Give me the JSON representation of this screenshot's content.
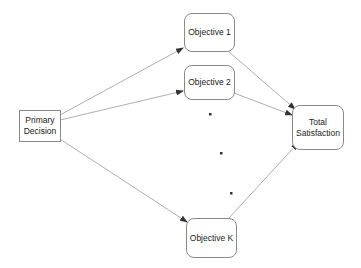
{
  "diagram": {
    "nodes": {
      "primary_decision": {
        "lines": [
          "Primary",
          "Decision"
        ]
      },
      "objective_1": {
        "label": "Objective 1"
      },
      "objective_2": {
        "label": "Objective 2"
      },
      "objective_k": {
        "label": "Objective K"
      },
      "total_satisfaction": {
        "lines": [
          "Total",
          "Satisfaction"
        ]
      }
    },
    "edges": [
      {
        "from": "primary_decision",
        "to": "objective_1"
      },
      {
        "from": "primary_decision",
        "to": "objective_2"
      },
      {
        "from": "primary_decision",
        "to": "objective_k"
      },
      {
        "from": "objective_1",
        "to": "total_satisfaction"
      },
      {
        "from": "objective_2",
        "to": "total_satisfaction"
      },
      {
        "from": "objective_k",
        "to": "total_satisfaction"
      }
    ],
    "ellipsis_dots": 3,
    "colors": {
      "edge": "#8a8a8a",
      "arrowhead": "#333333",
      "border": "#8a8a8a"
    }
  }
}
